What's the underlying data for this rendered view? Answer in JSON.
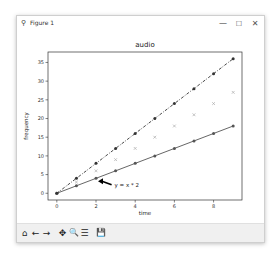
{
  "window": {
    "title": "Figure 1",
    "icon": "matplotlib-figure-icon",
    "controls": {
      "minimize": "—",
      "maximize": "☐",
      "close": "✕"
    }
  },
  "toolbar": {
    "buttons": [
      {
        "name": "home",
        "icon": "home-icon",
        "glyph": "⌂"
      },
      {
        "name": "back",
        "icon": "arrow-left-icon",
        "glyph": "←"
      },
      {
        "name": "forward",
        "icon": "arrow-right-icon",
        "glyph": "→"
      },
      {
        "name": "pan",
        "icon": "move-icon",
        "glyph": "✥"
      },
      {
        "name": "zoom",
        "icon": "magnifier-icon",
        "glyph": "🔍"
      },
      {
        "name": "configure",
        "icon": "sliders-icon",
        "glyph": "☰"
      },
      {
        "name": "save",
        "icon": "floppy-icon",
        "glyph": "💾"
      }
    ]
  },
  "chart_data": {
    "type": "line",
    "title": "audio",
    "xlabel": "time",
    "ylabel": "frequency",
    "x": [
      0,
      1,
      2,
      3,
      4,
      5,
      6,
      7,
      8,
      9
    ],
    "xlim": [
      -0.45,
      9.45
    ],
    "ylim": [
      -1.8,
      37.8
    ],
    "xticks": [
      0,
      2,
      4,
      6,
      8
    ],
    "yticks": [
      0,
      5,
      10,
      15,
      20,
      25,
      30,
      35
    ],
    "grid": false,
    "series": [
      {
        "name": "y = x * 2",
        "values": [
          0,
          2,
          4,
          6,
          8,
          10,
          12,
          14,
          16,
          18
        ],
        "style": "solid",
        "marker": "circle",
        "color": "#555555"
      },
      {
        "name": "y = x * 3",
        "values": [
          0,
          3,
          6,
          9,
          12,
          15,
          18,
          21,
          24,
          27
        ],
        "style": "none",
        "marker": "x",
        "color": "#aaaaaa"
      },
      {
        "name": "y = x * 4",
        "values": [
          0,
          4,
          8,
          12,
          16,
          20,
          24,
          28,
          32,
          36
        ],
        "style": "dashdot",
        "marker": "circle",
        "color": "#333333"
      }
    ],
    "annotation": {
      "text": "y = x * 2",
      "xy": [
        2,
        4
      ],
      "xytext": [
        3,
        2
      ],
      "arrow": true
    }
  }
}
